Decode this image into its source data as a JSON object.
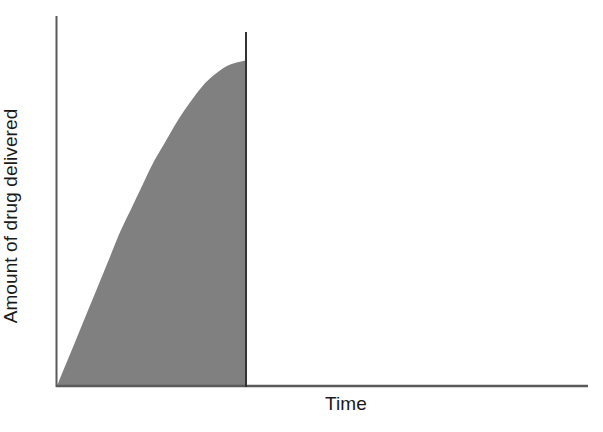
{
  "chart_data": {
    "type": "area",
    "title": "",
    "subtitle": "",
    "xlabel": "Time",
    "ylabel": "Amount of drug delivered",
    "grid": false,
    "legend": null,
    "axis_ticks": {
      "x": [],
      "y": []
    },
    "xlim": [
      0,
      1
    ],
    "ylim": [
      0,
      1
    ],
    "series": [
      {
        "name": "Amount of drug delivered",
        "fill_color": "#808080",
        "comment_shape": "saturating sigmoid rising from origin then flattening, truncated abruptly by a vertical line",
        "x": [
          0.0,
          0.02,
          0.04,
          0.06,
          0.08,
          0.1,
          0.12,
          0.14,
          0.16,
          0.18,
          0.2,
          0.22,
          0.24,
          0.26,
          0.28,
          0.3,
          0.32,
          0.34,
          0.355
        ],
        "y": [
          0.0,
          0.07,
          0.14,
          0.21,
          0.28,
          0.35,
          0.42,
          0.48,
          0.54,
          0.6,
          0.65,
          0.7,
          0.745,
          0.785,
          0.82,
          0.845,
          0.865,
          0.875,
          0.88
        ]
      }
    ],
    "annotations": [
      {
        "name": "cutoff-line",
        "type": "vertical-line",
        "x": 0.355,
        "color": "#333333",
        "label": ""
      }
    ],
    "colors": {
      "fill": "#808080",
      "axis": "#5a5a5a",
      "cutoff": "#333333",
      "text": "#1a1a1a",
      "background": "#ffffff"
    }
  },
  "axes": {
    "y_axis_label": "Amount of drug delivered",
    "x_axis_label": "Time"
  }
}
